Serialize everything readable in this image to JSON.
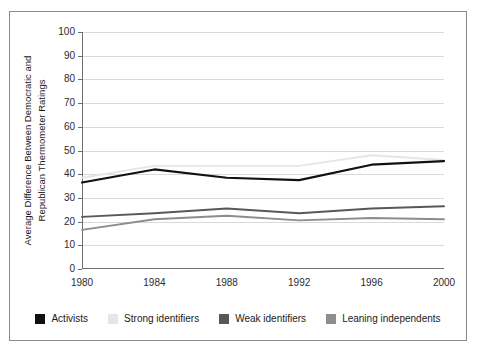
{
  "chart_data": {
    "type": "line",
    "title": "",
    "xlabel": "",
    "ylabel": "Average Difference Between Democratic and Republican Thermometer Ratings",
    "categories": [
      "1980",
      "1984",
      "1988",
      "1992",
      "1996",
      "2000"
    ],
    "x": [
      1980,
      1984,
      1988,
      1992,
      1996,
      2000
    ],
    "xlim": [
      1980,
      2000
    ],
    "ylim": [
      0,
      100
    ],
    "yticks": [
      0,
      10,
      20,
      30,
      40,
      50,
      60,
      70,
      80,
      90,
      100
    ],
    "ytick_labels": [
      "0",
      "10",
      "20",
      "30",
      "40",
      "50",
      "60",
      "70",
      "80",
      "90",
      "100"
    ],
    "grid": "horizontal",
    "legend_position": "bottom",
    "series": [
      {
        "name": "Activists",
        "color": "#111111",
        "values": [
          36.5,
          42.0,
          38.5,
          37.5,
          44.0,
          45.5
        ]
      },
      {
        "name": "Strong identifiers",
        "color": "#e6e6e6",
        "values": [
          38.5,
          43.5,
          43.5,
          43.5,
          48.0,
          46.0
        ]
      },
      {
        "name": "Weak identifiers",
        "color": "#585858",
        "values": [
          22.0,
          23.5,
          25.5,
          23.5,
          25.5,
          26.5
        ]
      },
      {
        "name": "Leaning independents",
        "color": "#8d8d8d",
        "values": [
          16.5,
          21.0,
          22.5,
          20.5,
          21.5,
          21.0
        ]
      }
    ]
  },
  "legend": {
    "items": [
      {
        "label": "Activists",
        "color": "#111111"
      },
      {
        "label": "Strong identifiers",
        "color": "#e6e6e6"
      },
      {
        "label": "Weak identifiers",
        "color": "#585858"
      },
      {
        "label": "Leaning independents",
        "color": "#8d8d8d"
      }
    ]
  }
}
